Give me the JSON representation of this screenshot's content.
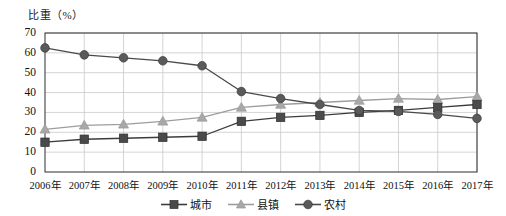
{
  "chart_data": {
    "type": "line",
    "title": "",
    "ylabel": "比重（%）",
    "xlabel": "",
    "categories": [
      "2006年",
      "2007年",
      "2008年",
      "2009年",
      "2010年",
      "2011年",
      "2012年",
      "2013年",
      "2014年",
      "2015年",
      "2016年",
      "2017年"
    ],
    "ylim": [
      0,
      70
    ],
    "ytick_step": 10,
    "yticks": [
      "70",
      "60",
      "50",
      "40",
      "30",
      "20",
      "10",
      "0"
    ],
    "ytick_values": [
      70,
      60,
      50,
      40,
      30,
      20,
      10,
      0
    ],
    "grid": true,
    "grid_horizontal": true,
    "grid_vertical": true,
    "legend_position": "bottom",
    "series": [
      {
        "name": "城市",
        "marker": "square",
        "color": "#4a4a4a",
        "line_color": "#3c3c3c",
        "values": [
          15,
          16.5,
          17,
          17.5,
          18,
          25.5,
          27.5,
          28.5,
          30,
          31,
          32.5,
          34
        ]
      },
      {
        "name": "县镇",
        "marker": "triangle",
        "color": "#a8a8a8",
        "line_color": "#9d9d9d",
        "values": [
          21.5,
          23.5,
          24,
          25.5,
          27.5,
          32.5,
          34,
          35,
          36,
          37,
          36.5,
          38
        ]
      },
      {
        "name": "农村",
        "marker": "circle",
        "color": "#5a5a5a",
        "line_color": "#4a4a4a",
        "values": [
          62.5,
          59,
          57.5,
          56,
          53.5,
          40.5,
          37,
          34,
          31,
          30.5,
          29,
          27
        ]
      }
    ]
  },
  "axis": {
    "y_title": "比重（%）"
  },
  "legend": {
    "items": [
      {
        "label": "城市",
        "icon": "square-marker-icon"
      },
      {
        "label": "县镇",
        "icon": "triangle-marker-icon"
      },
      {
        "label": "农村",
        "icon": "circle-marker-icon"
      }
    ]
  },
  "colors": {
    "frame": "#2c2c2c",
    "grid": "#c9c9c9",
    "background": "#ffffff"
  }
}
